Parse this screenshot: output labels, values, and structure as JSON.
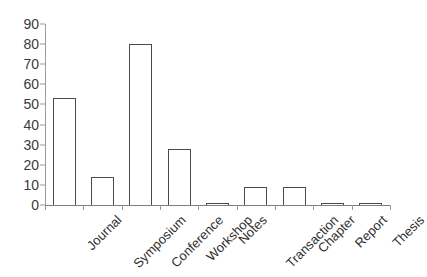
{
  "chart_data": {
    "type": "bar",
    "title": "",
    "subtitle": "",
    "xlabel": "",
    "ylabel": "",
    "categories": [
      "Journal",
      "Symposium",
      "Conference",
      "Workshop",
      "Notes",
      "Transaction",
      "Chapter",
      "Report",
      "Thesis"
    ],
    "values": [
      53,
      14,
      80,
      28,
      1,
      9,
      9,
      1,
      1
    ],
    "ylim": [
      0,
      90
    ],
    "ytick_labels": [
      "90",
      "80",
      "70",
      "60",
      "50",
      "40",
      "30",
      "20",
      "10",
      "0"
    ],
    "ytick_values": [
      90,
      80,
      70,
      60,
      50,
      40,
      30,
      20,
      10,
      0
    ],
    "ytick_step": 10,
    "grid": false,
    "legend": false,
    "legend_position": "none",
    "bar_fill_color": "#ffffff",
    "bar_border_color": "#4a4a4a",
    "axis_color": "#9a9a9a",
    "text_color": "#2f2f2f",
    "background_color": "#ffffff",
    "xtick_label_rotation": -45
  }
}
